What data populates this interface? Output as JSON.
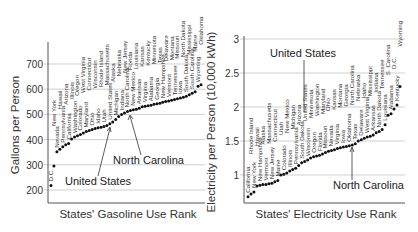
{
  "chart_data": [
    {
      "type": "scatter",
      "title": "",
      "xlabel": "States' Gasoline Use Rank",
      "ylabel": "Gallons per Person",
      "yticks": [
        200,
        300,
        400,
        500,
        600,
        700
      ],
      "ylim": [
        160,
        780
      ],
      "grid": "horizontal",
      "annotations": [
        "United States",
        "North Carolina"
      ],
      "states": [
        "D.C.",
        "New York",
        "Nevada",
        "Hawaii",
        "Pennsylvania",
        "Arizona",
        "California",
        "Illinois",
        "Washington",
        "Oregon",
        "Colorado",
        "West Virginia",
        "Maryland",
        "Connecticut",
        "Ohio",
        "Wisconsin",
        "Idaho",
        "Rhode Island",
        "Utah",
        "Massachusetts",
        "United States",
        "Alaska",
        "Michigan",
        "Nebraska",
        "Indiana",
        "New Jersey",
        "North Carolina",
        "Florida",
        "New Mexico",
        "Louisiana",
        "Arkansas",
        "Kansas",
        "Virginia",
        "Kentucky",
        "Alabama",
        "Minnesota",
        "Georgia",
        "Texas",
        "New Hampshire",
        "Delaware",
        "Vermont",
        "Montana",
        "Tennessee",
        "Missouri",
        "Iowa",
        "North Dakota",
        "South Dakota",
        "Mississippi",
        "South Carolina",
        "Maine",
        "Wyoming",
        "Oklahoma"
      ],
      "values": [
        218,
        295,
        352,
        362,
        372,
        380,
        385,
        402,
        410,
        415,
        420,
        426,
        432,
        436,
        440,
        444,
        447,
        449,
        452,
        456,
        463,
        470,
        480,
        492,
        500,
        506,
        512,
        515,
        518,
        520,
        524,
        530,
        532,
        534,
        536,
        540,
        542,
        544,
        548,
        551,
        553,
        556,
        559,
        562,
        565,
        568,
        572,
        578,
        584,
        590,
        612,
        618
      ]
    },
    {
      "type": "scatter",
      "title": "",
      "xlabel": "States' Electricity Use Rank",
      "ylabel": "Electricity per Person (10,000 kWh)",
      "yticks": [
        1,
        1.5,
        2,
        2.5,
        3
      ],
      "ylim": [
        0.6,
        3.05
      ],
      "grid": "horizontal",
      "annotations": [
        "United States",
        "North Carolina"
      ],
      "states": [
        "California",
        "Rhode Island",
        "New York",
        "Hawaii",
        "New Hampshire",
        "Alaska",
        "Vermont",
        "Massachusetts",
        "New Jersey",
        "Connecticut",
        "Maine",
        "Utah",
        "Colorado",
        "New Mexico",
        "Illinois",
        "Michigan",
        "Pennsylvania",
        "Arizona",
        "South Dakota",
        "United States",
        "Wisconsin",
        "Minnesota",
        "Oregon",
        "Washington",
        "Florida",
        "Maryland",
        "Missouri",
        "Ohio",
        "Nevada",
        "Kansas",
        "Virginia",
        "Montana",
        "Iowa",
        "Georgia",
        "Oklahoma",
        "North Carolina",
        "Texas",
        "Nebraska",
        "Delaware",
        "Idaho",
        "West Virginia",
        "Mississippi",
        "Arkansas",
        "Indiana",
        "North Dakota",
        "Tennessee",
        "Louisiana",
        "S. Carolina",
        "Alabama",
        "D.C.",
        "Kentucky",
        "Wyoming"
      ],
      "values": [
        0.68,
        0.72,
        0.75,
        0.84,
        0.85,
        0.86,
        0.86,
        0.87,
        0.88,
        0.9,
        0.92,
        1.0,
        1.01,
        1.03,
        1.06,
        1.08,
        1.1,
        1.14,
        1.18,
        1.2,
        1.22,
        1.25,
        1.27,
        1.28,
        1.29,
        1.31,
        1.33,
        1.35,
        1.36,
        1.37,
        1.39,
        1.4,
        1.41,
        1.42,
        1.43,
        1.44,
        1.46,
        1.5,
        1.52,
        1.54,
        1.56,
        1.57,
        1.59,
        1.62,
        1.64,
        1.67,
        1.74,
        1.88,
        1.9,
        1.97,
        2.03,
        2.3
      ]
    }
  ],
  "left": {
    "ylabel": "Gallons per Person",
    "xlabel": "States' Gasoline Use Rank",
    "ticks": [
      "700",
      "600",
      "500",
      "400",
      "300",
      "200"
    ],
    "ann_us": "United States",
    "ann_nc": "North Carolina"
  },
  "right": {
    "ylabel": "Electricity per Person (10,000 kWh)",
    "xlabel": "States' Electricity Use Rank",
    "ticks": [
      "3",
      "2.5",
      "2",
      "1.5",
      "1"
    ],
    "ann_us": "United States",
    "ann_nc": "North Carolina"
  }
}
